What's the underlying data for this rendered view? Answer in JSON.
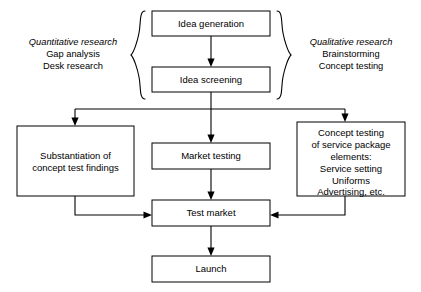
{
  "diagram": {
    "type": "flowchart",
    "background_color": "#ffffff",
    "line_color": "#000000",
    "box_fill": "#ffffff"
  },
  "nodes": {
    "idea_generation": {
      "label": "Idea generation"
    },
    "idea_screening": {
      "label": "Idea screening"
    },
    "substantiation": {
      "lines": [
        "Substantiation of",
        "concept test findings"
      ]
    },
    "market_testing": {
      "label": "Market testing"
    },
    "concept_testing": {
      "lines": [
        "Concept testing",
        "of service package",
        "elements:",
        "Service setting",
        "Uniforms",
        "Advertising, etc."
      ]
    },
    "test_market": {
      "label": "Test market"
    },
    "launch": {
      "label": "Launch"
    }
  },
  "annotations": {
    "left": {
      "title": "Quantitative research",
      "lines": [
        "Gap analysis",
        "Desk research"
      ]
    },
    "right": {
      "title": "Qualitative research",
      "lines": [
        "Brainstorming",
        "Concept testing"
      ]
    }
  }
}
